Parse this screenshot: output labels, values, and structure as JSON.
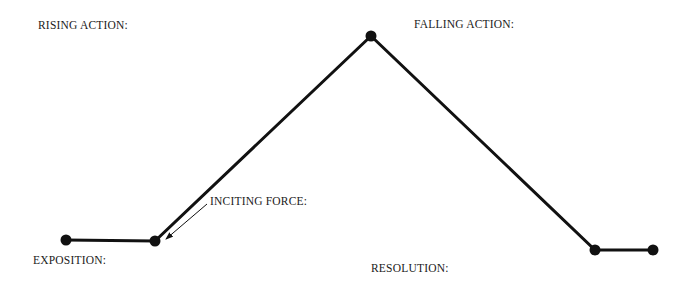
{
  "diagram": {
    "type": "plot-structure",
    "colors": {
      "line": "#111111",
      "text": "#1a1a1a",
      "background": "#ffffff"
    },
    "points": [
      {
        "id": "exposition-start",
        "x": 66,
        "y": 240
      },
      {
        "id": "inciting-force",
        "x": 155,
        "y": 241
      },
      {
        "id": "climax",
        "x": 371,
        "y": 36
      },
      {
        "id": "resolution-start",
        "x": 595,
        "y": 250
      },
      {
        "id": "resolution-end",
        "x": 653,
        "y": 250
      }
    ],
    "labels": {
      "rising_action": "RISING ACTION:",
      "falling_action": "FALLING ACTION:",
      "inciting_force": "INCITING FORCE:",
      "exposition": "EXPOSITION:",
      "resolution": "RESOLUTION:"
    }
  }
}
